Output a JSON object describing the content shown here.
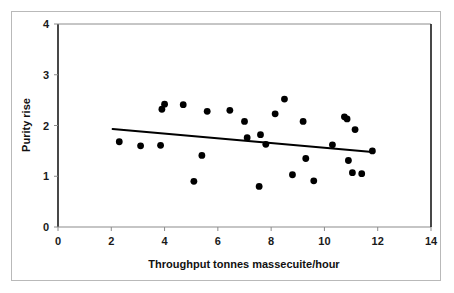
{
  "chart_data": {
    "type": "scatter",
    "title": "",
    "xlabel": "Throughput tonnes massecuite/hour",
    "ylabel": "Purity rise",
    "xlim": [
      0,
      14
    ],
    "ylim": [
      0,
      4
    ],
    "xticks": [
      0,
      2,
      4,
      6,
      8,
      10,
      12,
      14
    ],
    "yticks": [
      0,
      1,
      2,
      3,
      4
    ],
    "xtick_labels": [
      "0",
      "2",
      "4",
      "6",
      "8",
      "10",
      "12",
      "14"
    ],
    "ytick_labels": [
      "0",
      "1",
      "2",
      "3",
      "4"
    ],
    "grid": false,
    "legend": false,
    "marker": "filled-circle",
    "marker_color": "#000000",
    "points": [
      [
        2.3,
        1.68
      ],
      [
        3.1,
        1.6
      ],
      [
        3.85,
        1.61
      ],
      [
        3.9,
        2.32
      ],
      [
        4.0,
        2.42
      ],
      [
        4.7,
        2.41
      ],
      [
        5.1,
        0.9
      ],
      [
        5.4,
        1.41
      ],
      [
        5.6,
        2.28
      ],
      [
        6.45,
        2.3
      ],
      [
        7.0,
        2.08
      ],
      [
        7.1,
        1.76
      ],
      [
        7.55,
        0.8
      ],
      [
        7.6,
        1.82
      ],
      [
        7.8,
        1.63
      ],
      [
        8.15,
        2.23
      ],
      [
        8.5,
        2.52
      ],
      [
        8.8,
        1.03
      ],
      [
        9.2,
        2.08
      ],
      [
        9.3,
        1.35
      ],
      [
        9.6,
        0.91
      ],
      [
        10.3,
        1.62
      ],
      [
        10.75,
        2.17
      ],
      [
        10.85,
        2.13
      ],
      [
        10.9,
        1.31
      ],
      [
        11.05,
        1.07
      ],
      [
        11.15,
        1.92
      ],
      [
        11.4,
        1.05
      ],
      [
        11.8,
        1.5
      ]
    ],
    "trendline": {
      "label": "linear fit",
      "x_start": 2.05,
      "y_start": 1.93,
      "x_end": 11.8,
      "y_end": 1.48,
      "color": "#000000",
      "width": 2
    }
  }
}
